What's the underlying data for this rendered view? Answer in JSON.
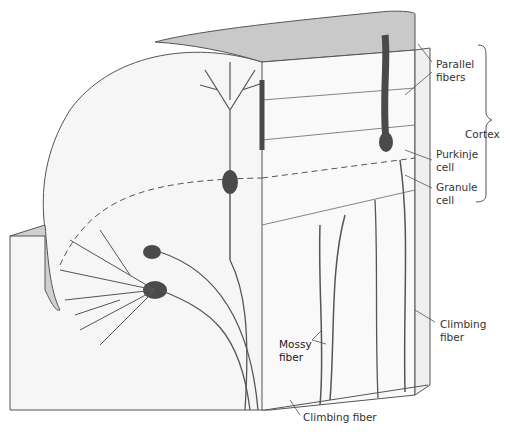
{
  "figure": {
    "labels": {
      "parallel_fibers": "Parallel\nfibers",
      "cortex": "Cortex",
      "purkinje_cell": "Purkinje\ncell",
      "granule_cell": "Granule\ncell",
      "mossy_fiber": "Mossy\nfiber",
      "climbing_fiber_right": "Climbing\nfiber",
      "climbing_fiber_bottom": "Climbing fiber"
    },
    "colors": {
      "line": "#555555",
      "neuron_fill": "#4a4a4a",
      "top_surface": "#c8c8c8",
      "face": "#f7f7f7",
      "label_text": "#333333"
    }
  }
}
